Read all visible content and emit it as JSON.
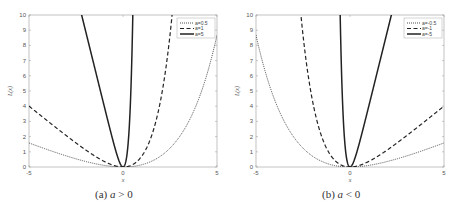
{
  "chart_data": [
    {
      "type": "line",
      "title": "",
      "caption_prefix": "(a)",
      "caption_var": "a",
      "caption_rel": "> 0",
      "xlabel": "x",
      "ylabel": "L(x)",
      "xlim": [
        -5,
        5
      ],
      "ylim": [
        0,
        10
      ],
      "xticks": [
        "-5",
        "0",
        "5"
      ],
      "yticks": [
        "0",
        "1",
        "2",
        "3",
        "4",
        "5",
        "6",
        "7",
        "8",
        "9",
        "10"
      ],
      "grid": false,
      "legend_position": "upper right",
      "function": "L(x) = exp(a*x) - a*x - 1",
      "series": [
        {
          "name": "a=0.5",
          "a": 0.5,
          "style": "dotted",
          "sample": {
            "x": [
              -5,
              0,
              5
            ],
            "y": [
              1.58,
              0,
              8.68
            ]
          }
        },
        {
          "name": "a=1",
          "a": 1,
          "style": "dashed",
          "sample": {
            "x": [
              -5,
              0,
              2.6
            ],
            "y": [
              4.01,
              0,
              10
            ]
          }
        },
        {
          "name": "a=5",
          "a": 5,
          "style": "solid",
          "sample": {
            "x": [
              -2.2,
              0,
              0.55
            ],
            "y": [
              10,
              0,
              10
            ]
          }
        }
      ]
    },
    {
      "type": "line",
      "title": "",
      "caption_prefix": "(b)",
      "caption_var": "a",
      "caption_rel": "< 0",
      "xlabel": "x",
      "ylabel": "L(x)",
      "xlim": [
        -5,
        5
      ],
      "ylim": [
        0,
        10
      ],
      "xticks": [
        "-5",
        "0",
        "5"
      ],
      "yticks": [
        "0",
        "1",
        "2",
        "3",
        "4",
        "5",
        "6",
        "7",
        "8",
        "9",
        "10"
      ],
      "grid": false,
      "legend_position": "upper right",
      "function": "L(x) = exp(a*x) - a*x - 1",
      "series": [
        {
          "name": "a=-0.5",
          "a": -0.5,
          "style": "dotted",
          "sample": {
            "x": [
              -5,
              0,
              5
            ],
            "y": [
              8.68,
              0,
              1.58
            ]
          }
        },
        {
          "name": "a=-1",
          "a": -1,
          "style": "dashed",
          "sample": {
            "x": [
              -2.6,
              0,
              5
            ],
            "y": [
              10,
              0,
              4.01
            ]
          }
        },
        {
          "name": "a=-5",
          "a": -5,
          "style": "solid",
          "sample": {
            "x": [
              -0.55,
              0,
              2.2
            ],
            "y": [
              10,
              0,
              10
            ]
          }
        }
      ]
    }
  ]
}
